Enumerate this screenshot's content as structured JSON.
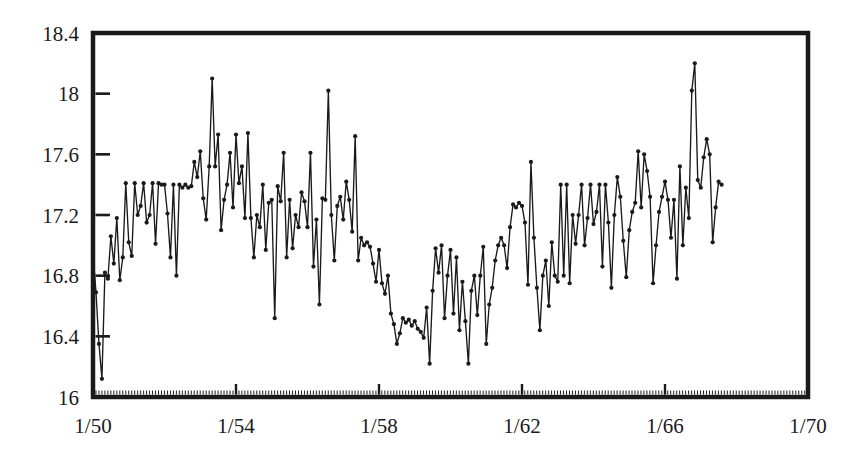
{
  "chart_data": {
    "type": "line",
    "title": "",
    "subtitle": "",
    "xlabel": "",
    "ylabel": "",
    "grid": false,
    "legend": null,
    "marker": "filled-circle",
    "line_color": "#1a1a1a",
    "marker_color": "#1a1a1a",
    "background_color": "#ffffff",
    "axis_color": "#1a1a1a",
    "x_tick_labels": [
      "1/50",
      "1/54",
      "1/58",
      "1/62",
      "1/66",
      "1/70"
    ],
    "x_tick_values": [
      1950.0,
      1954.0,
      1958.0,
      1962.0,
      1966.0,
      1970.0
    ],
    "xlim": [
      1950.0,
      1970.0
    ],
    "x_minor_tick_interval": 0.0833,
    "y_tick_labels": [
      "16",
      "16.4",
      "16.8",
      "17.2",
      "17.6",
      "18",
      "18.4"
    ],
    "y_tick_values": [
      16,
      16.4,
      16.8,
      17.2,
      17.6,
      18,
      18.4
    ],
    "ylim": [
      16,
      18.4
    ],
    "x_start": 1950.0,
    "x_step": 0.08333333,
    "x_note": "monthly observations beginning January 1950",
    "values": [
      16.95,
      16.69,
      16.35,
      16.12,
      16.82,
      16.78,
      17.06,
      16.88,
      17.18,
      16.77,
      16.92,
      17.41,
      17.02,
      16.93,
      17.41,
      17.2,
      17.26,
      17.41,
      17.15,
      17.2,
      17.41,
      17.01,
      17.41,
      17.4,
      17.4,
      17.21,
      16.92,
      17.4,
      16.8,
      17.4,
      17.38,
      17.4,
      17.38,
      17.39,
      17.55,
      17.45,
      17.62,
      17.31,
      17.17,
      17.52,
      18.1,
      17.52,
      17.73,
      17.1,
      17.3,
      17.4,
      17.61,
      17.25,
      17.73,
      17.41,
      17.52,
      17.18,
      17.74,
      17.18,
      16.92,
      17.2,
      17.12,
      17.4,
      16.97,
      17.28,
      17.3,
      16.52,
      17.39,
      17.29,
      17.61,
      16.92,
      17.3,
      16.98,
      17.2,
      17.12,
      17.35,
      17.29,
      17.12,
      17.61,
      16.86,
      17.17,
      16.61,
      17.31,
      17.3,
      18.02,
      17.2,
      16.9,
      17.26,
      17.32,
      17.17,
      17.42,
      17.3,
      17.09,
      17.72,
      16.9,
      17.05,
      17.0,
      17.02,
      16.99,
      16.88,
      16.76,
      16.97,
      16.75,
      16.68,
      16.8,
      16.55,
      16.48,
      16.35,
      16.42,
      16.52,
      16.49,
      16.51,
      16.47,
      16.5,
      16.45,
      16.43,
      16.39,
      16.59,
      16.22,
      16.7,
      16.98,
      16.82,
      17.0,
      16.52,
      16.8,
      16.97,
      16.55,
      16.92,
      16.44,
      16.76,
      16.5,
      16.22,
      16.7,
      16.8,
      16.54,
      16.8,
      16.99,
      16.35,
      16.61,
      16.72,
      16.9,
      17.0,
      17.05,
      17.0,
      16.85,
      17.12,
      17.27,
      17.25,
      17.28,
      17.26,
      17.15,
      16.74,
      17.55,
      17.05,
      16.72,
      16.44,
      16.8,
      16.9,
      16.6,
      17.02,
      16.8,
      16.76,
      17.4,
      16.8,
      17.4,
      16.75,
      17.2,
      17.01,
      17.2,
      17.4,
      17.0,
      17.18,
      17.4,
      17.14,
      17.22,
      17.4,
      16.86,
      17.4,
      17.15,
      16.72,
      17.2,
      17.45,
      17.32,
      17.03,
      16.79,
      17.1,
      17.22,
      17.28,
      17.62,
      17.25,
      17.6,
      17.49,
      17.32,
      16.75,
      17.0,
      17.22,
      17.32,
      17.42,
      17.3,
      17.05,
      17.3,
      16.78,
      17.52,
      17.0,
      17.38,
      17.18,
      18.02,
      18.2,
      17.43,
      17.38,
      17.58,
      17.7,
      17.6,
      17.02,
      17.25,
      17.42,
      17.4
    ],
    "y_min_observed": 16.12,
    "y_max_observed": 18.2,
    "n_points": 202,
    "data_end_label": "mid-1966"
  }
}
